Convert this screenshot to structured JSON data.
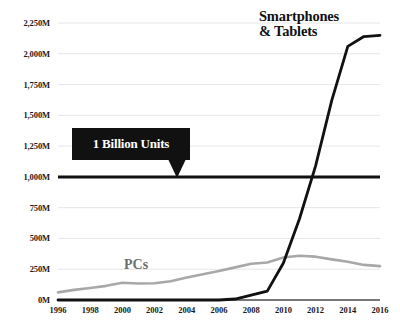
{
  "chart_data": {
    "type": "line",
    "title": "",
    "subtitle": "",
    "xlabel": "",
    "ylabel": "",
    "xlim": [
      1996,
      2016
    ],
    "ylim": [
      0,
      2250
    ],
    "grid": true,
    "legend_position": "inline-labels",
    "y_tick_labels": [
      "2,250M",
      "2,000M",
      "1,750M",
      "1,500M",
      "1,250M",
      "1,000M",
      "750M",
      "500M",
      "250M",
      "0M"
    ],
    "y_tick_values": [
      2250,
      2000,
      1750,
      1500,
      1250,
      1000,
      750,
      500,
      250,
      0
    ],
    "x_tick_labels": [
      "1996",
      "1998",
      "2000",
      "2002",
      "2004",
      "2006",
      "2008",
      "2010",
      "2012",
      "2014",
      "2016"
    ],
    "x_tick_values": [
      1996,
      1998,
      2000,
      2002,
      2004,
      2006,
      2008,
      2010,
      2012,
      2014,
      2016
    ],
    "x": [
      1996,
      1997,
      1998,
      1999,
      2000,
      2001,
      2002,
      2003,
      2004,
      2005,
      2006,
      2007,
      2008,
      2009,
      2010,
      2011,
      2012,
      2013,
      2014,
      2015,
      2016
    ],
    "series": [
      {
        "name": "PCs",
        "color": "#a8a8a8",
        "values": [
          62,
          82,
          98,
          115,
          140,
          134,
          136,
          152,
          183,
          210,
          235,
          265,
          295,
          305,
          345,
          360,
          352,
          330,
          310,
          285,
          275
        ]
      },
      {
        "name": "Smartphones & Tablets",
        "color": "#111111",
        "values": [
          0,
          0,
          0,
          0,
          0,
          0,
          0,
          0,
          0,
          0,
          0,
          8,
          40,
          72,
          300,
          660,
          1090,
          1620,
          2060,
          2140,
          2150
        ]
      }
    ],
    "annotations": [
      {
        "name": "one-billion-units",
        "text": "1 Billion Units",
        "value": 1000,
        "style": "black-callout-box-with-pointer"
      }
    ],
    "reference_lines": [
      {
        "name": "one-billion-line",
        "value": 1000,
        "color": "#111111",
        "width": 3
      }
    ],
    "colors": {
      "pcs_line": "#a8a8a8",
      "smartphones_line": "#111111",
      "gridline": "#e6e6e6",
      "axis": "#4d4d4d",
      "callout_bg": "#111111",
      "callout_text": "#ffffff",
      "background": "#ffffff"
    }
  },
  "labels": {
    "smartphones_line1": "Smartphones",
    "smartphones_line2": "& Tablets",
    "pcs": "PCs",
    "callout": "1 Billion Units"
  }
}
